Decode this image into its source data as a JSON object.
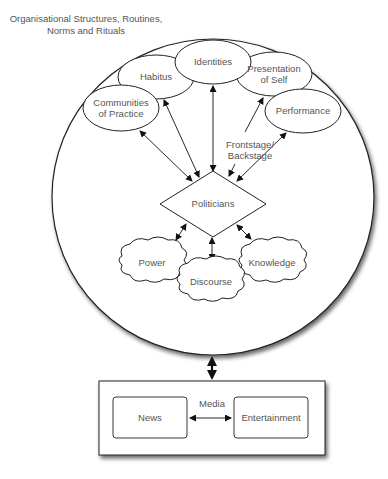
{
  "diagram": {
    "outer_context": {
      "title_line1": "Organisational Structures, Routines,",
      "title_line2": "Norms and Rituals"
    },
    "nodes": {
      "identities": "Identities",
      "habitus": "Habitus",
      "presentation_line1": "Presentation",
      "presentation_line2": "of Self",
      "performance": "Performance",
      "communities_line1": "Communities",
      "communities_line2": "of Practice",
      "politicians": "Politicians",
      "power": "Power",
      "discourse": "Discourse",
      "knowledge": "Knowledge"
    },
    "edge_labels": {
      "frontstage_line1": "Frontstage/",
      "frontstage_line2": "Backstage"
    },
    "media": {
      "title": "Media",
      "news": "News",
      "entertainment": "Entertainment"
    },
    "colors": {
      "stroke": "#222222",
      "text": "#555555",
      "background": "#ffffff"
    }
  }
}
